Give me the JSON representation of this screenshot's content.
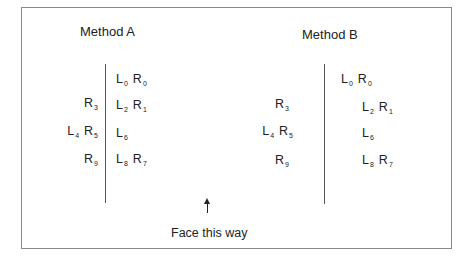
{
  "diagram": {
    "methods": [
      {
        "title": "Method A",
        "left_column": [
          {
            "row": 1,
            "tokens": []
          },
          {
            "row": 2,
            "tokens": [
              {
                "base": "R",
                "sub": "3"
              }
            ]
          },
          {
            "row": 3,
            "tokens": [
              {
                "base": "L",
                "sub": "4"
              },
              {
                "base": "R",
                "sub": "5"
              }
            ]
          },
          {
            "row": 4,
            "tokens": [
              {
                "base": "R",
                "sub": "9"
              }
            ]
          }
        ],
        "right_column": [
          {
            "row": 1,
            "tokens": [
              {
                "base": "L",
                "sub": "0"
              },
              {
                "base": "R",
                "sub": "0"
              }
            ]
          },
          {
            "row": 2,
            "tokens": [
              {
                "base": "L",
                "sub": "2"
              },
              {
                "base": "R",
                "sub": "1"
              }
            ]
          },
          {
            "row": 3,
            "tokens": [
              {
                "base": "L",
                "sub": "6"
              }
            ]
          },
          {
            "row": 4,
            "tokens": [
              {
                "base": "L",
                "sub": "8"
              },
              {
                "base": "R",
                "sub": "7"
              }
            ]
          }
        ]
      },
      {
        "title": "Method B",
        "left_column": [
          {
            "row": 1,
            "tokens": []
          },
          {
            "row": 2,
            "tokens": [
              {
                "base": "R",
                "sub": "3"
              }
            ]
          },
          {
            "row": 3,
            "tokens": [
              {
                "base": "L",
                "sub": "4"
              },
              {
                "base": "R",
                "sub": "5"
              }
            ]
          },
          {
            "row": 4,
            "tokens": [
              {
                "base": "R",
                "sub": "9"
              }
            ]
          }
        ],
        "right_column": [
          {
            "row": 1,
            "tokens": [
              {
                "base": "L",
                "sub": "0"
              },
              {
                "base": "R",
                "sub": "0"
              }
            ]
          },
          {
            "row": 2,
            "tokens": [
              {
                "base": "L",
                "sub": "2"
              },
              {
                "base": "R",
                "sub": "1"
              }
            ]
          },
          {
            "row": 3,
            "tokens": [
              {
                "base": "L",
                "sub": "6"
              }
            ]
          },
          {
            "row": 4,
            "tokens": [
              {
                "base": "L",
                "sub": "8"
              },
              {
                "base": "R",
                "sub": "7"
              }
            ]
          }
        ]
      }
    ],
    "direction_label": "Face this way",
    "direction_icon": "arrow-up-icon"
  }
}
